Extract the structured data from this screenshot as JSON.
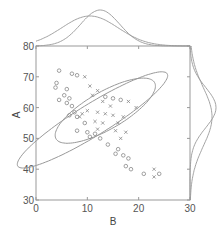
{
  "chart_data": {
    "type": "scatter",
    "title": "",
    "xlabel": "B",
    "ylabel": "A",
    "xlim": [
      0,
      30
    ],
    "ylim": [
      30,
      80
    ],
    "xticks": [
      0,
      10,
      20,
      30
    ],
    "yticks": [
      30,
      40,
      50,
      60,
      70,
      80
    ],
    "grid": false,
    "legend": null,
    "colors": {
      "axis": "#999999",
      "points": "#888888",
      "ellipse": "#999999",
      "density": "#999999"
    },
    "series": [
      {
        "name": "group-circle",
        "marker": "o",
        "points": [
          [
            4.5,
            72.0
          ],
          [
            7.0,
            71.0
          ],
          [
            8.0,
            70.5
          ],
          [
            4.0,
            68.0
          ],
          [
            3.8,
            66.5
          ],
          [
            6.0,
            66.0
          ],
          [
            5.5,
            64.0
          ],
          [
            6.5,
            63.0
          ],
          [
            4.5,
            62.5
          ],
          [
            6.0,
            61.5
          ],
          [
            7.0,
            60.5
          ],
          [
            7.5,
            58.5
          ],
          [
            6.5,
            57.5
          ],
          [
            8.0,
            57.0
          ],
          [
            9.5,
            55.0
          ],
          [
            8.0,
            52.5
          ],
          [
            10.0,
            52.0
          ],
          [
            11.5,
            51.5
          ],
          [
            10.5,
            50.5
          ],
          [
            12.5,
            50.0
          ],
          [
            14.0,
            48.0
          ],
          [
            16.0,
            46.5
          ],
          [
            15.5,
            45.0
          ],
          [
            17.0,
            44.5
          ],
          [
            18.0,
            43.5
          ],
          [
            17.5,
            41.0
          ],
          [
            18.5,
            40.0
          ],
          [
            21.0,
            38.5
          ],
          [
            24.0,
            38.5
          ],
          [
            13.5,
            63.5
          ],
          [
            15.0,
            63.0
          ],
          [
            16.5,
            62.5
          ]
        ]
      },
      {
        "name": "group-cross",
        "marker": "x",
        "points": [
          [
            9.5,
            70.0
          ],
          [
            10.5,
            67.0
          ],
          [
            12.0,
            65.5
          ],
          [
            11.0,
            64.0
          ],
          [
            13.0,
            62.0
          ],
          [
            14.5,
            60.5
          ],
          [
            10.0,
            59.0
          ],
          [
            12.0,
            58.5
          ],
          [
            13.5,
            58.0
          ],
          [
            15.0,
            57.5
          ],
          [
            9.0,
            58.0
          ],
          [
            8.5,
            57.0
          ],
          [
            11.5,
            55.5
          ],
          [
            13.0,
            55.0
          ],
          [
            16.0,
            55.0
          ],
          [
            17.0,
            57.0
          ],
          [
            15.5,
            52.5
          ],
          [
            17.5,
            52.0
          ],
          [
            12.0,
            53.0
          ],
          [
            16.5,
            50.0
          ],
          [
            23.0,
            40.0
          ],
          [
            23.0,
            37.5
          ],
          [
            18.0,
            62.0
          ],
          [
            19.5,
            60.0
          ]
        ]
      }
    ],
    "ellipses": [
      {
        "name": "ellipse-circle",
        "cx": 11.0,
        "cy": 56.0,
        "rx_axis": 21.0,
        "ry_axis": 4.2,
        "angle_deg": -47
      },
      {
        "name": "ellipse-cross",
        "cx": 13.5,
        "cy": 59.0,
        "rx_axis": 13.5,
        "ry_axis": 5.0,
        "angle_deg": -48
      }
    ],
    "marginal_x": {
      "baseline_value": 80,
      "curves": [
        {
          "name": "density-x-circle",
          "mean": 10.5,
          "sd": 5.5,
          "peak_px": 30
        },
        {
          "name": "density-x-cross",
          "mean": 12.5,
          "sd": 3.8,
          "peak_px": 36
        }
      ]
    },
    "marginal_y": {
      "baseline_value": 30,
      "curves": [
        {
          "name": "density-y-circle",
          "mean": 57.0,
          "sd": 9.5,
          "peak_px": 22
        },
        {
          "name": "density-y-cross",
          "mean": 60.0,
          "sd": 6.5,
          "peak_px": 26
        }
      ]
    }
  }
}
